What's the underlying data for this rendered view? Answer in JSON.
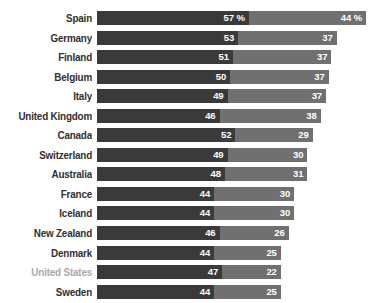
{
  "chart_data": {
    "type": "bar",
    "orientation": "horizontal",
    "stacked": true,
    "title": "",
    "subtitle": "",
    "xlabel": "",
    "ylabel": "",
    "unit": "%",
    "grid": false,
    "legend_position": "none",
    "axis_visible": false,
    "value_label_color": "#ffffff",
    "colors": {
      "series_1": "#3a3a3a",
      "series_2": "#707070",
      "label": "#303030",
      "label_highlight": "#a9a9a9",
      "background": "#ffffff"
    },
    "categories": [
      "Spain",
      "Germany",
      "Finland",
      "Belgium",
      "Italy",
      "United Kingdom",
      "Canada",
      "Switzerland",
      "Australia",
      "France",
      "Iceland",
      "New Zealand",
      "Denmark",
      "United States",
      "Sweden"
    ],
    "series": [
      {
        "name": "series_1",
        "values": [
          57,
          53,
          51,
          50,
          49,
          46,
          52,
          49,
          48,
          44,
          44,
          46,
          44,
          47,
          44
        ]
      },
      {
        "name": "series_2",
        "values": [
          44,
          37,
          37,
          37,
          37,
          38,
          29,
          30,
          31,
          30,
          30,
          26,
          25,
          22,
          25
        ]
      }
    ],
    "xlim": [
      0,
      101
    ]
  },
  "rows": [
    {
      "label": "Spain",
      "muted": false,
      "v1": 57,
      "v2": 44,
      "v1_label": "57 %",
      "v2_label": "44 %"
    },
    {
      "label": "Germany",
      "muted": false,
      "v1": 53,
      "v2": 37,
      "v1_label": "53",
      "v2_label": "37"
    },
    {
      "label": "Finland",
      "muted": false,
      "v1": 51,
      "v2": 37,
      "v1_label": "51",
      "v2_label": "37"
    },
    {
      "label": "Belgium",
      "muted": false,
      "v1": 50,
      "v2": 37,
      "v1_label": "50",
      "v2_label": "37"
    },
    {
      "label": "Italy",
      "muted": false,
      "v1": 49,
      "v2": 37,
      "v1_label": "49",
      "v2_label": "37"
    },
    {
      "label": "United Kingdom",
      "muted": false,
      "v1": 46,
      "v2": 38,
      "v1_label": "46",
      "v2_label": "38"
    },
    {
      "label": "Canada",
      "muted": false,
      "v1": 52,
      "v2": 29,
      "v1_label": "52",
      "v2_label": "29"
    },
    {
      "label": "Switzerland",
      "muted": false,
      "v1": 49,
      "v2": 30,
      "v1_label": "49",
      "v2_label": "30"
    },
    {
      "label": "Australia",
      "muted": false,
      "v1": 48,
      "v2": 31,
      "v1_label": "48",
      "v2_label": "31"
    },
    {
      "label": "France",
      "muted": false,
      "v1": 44,
      "v2": 30,
      "v1_label": "44",
      "v2_label": "30"
    },
    {
      "label": "Iceland",
      "muted": false,
      "v1": 44,
      "v2": 30,
      "v1_label": "44",
      "v2_label": "30"
    },
    {
      "label": "New Zealand",
      "muted": false,
      "v1": 46,
      "v2": 26,
      "v1_label": "46",
      "v2_label": "26"
    },
    {
      "label": "Denmark",
      "muted": false,
      "v1": 44,
      "v2": 25,
      "v1_label": "44",
      "v2_label": "25"
    },
    {
      "label": "United States",
      "muted": true,
      "v1": 47,
      "v2": 22,
      "v1_label": "47",
      "v2_label": "22"
    },
    {
      "label": "Sweden",
      "muted": false,
      "v1": 44,
      "v2": 25,
      "v1_label": "44",
      "v2_label": "25"
    }
  ]
}
